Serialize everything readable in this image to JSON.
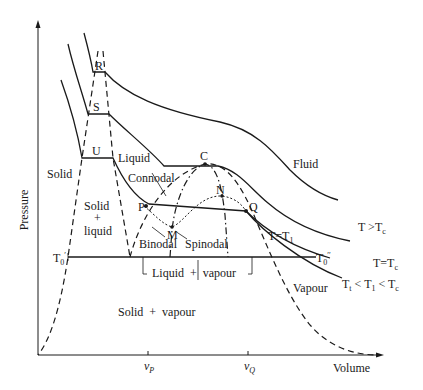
{
  "diagram": {
    "type": "pressure-volume phase diagram",
    "axes": {
      "y_label": "Pressure",
      "x_label": "Volume",
      "x_ticks": [
        {
          "symbol": "v",
          "subscript": "P"
        },
        {
          "symbol": "v",
          "subscript": "Q"
        }
      ]
    },
    "points": {
      "R": "R",
      "S": "S",
      "U": "U",
      "C": "C",
      "P": "P",
      "Q": "Q",
      "M": "M",
      "N": "N",
      "T0_prime": {
        "base": "T",
        "sub": "0",
        "mark": "′"
      },
      "T0_double_prime": {
        "base": "T",
        "sub": "0",
        "mark": "′′"
      }
    },
    "regions": {
      "solid": "Solid",
      "liquid": "Liquid",
      "fluid": "Fluid",
      "vapour": "Vapour",
      "solid_liquid_1": "Solid",
      "solid_liquid_2": "+",
      "solid_liquid_3": "liquid",
      "solid_vapour": "Solid  +  vapour",
      "liquid_vapour": "Liquid  +  vapour"
    },
    "curve_labels": {
      "connodal": "Connodal",
      "binodal": "Binodal",
      "spinodal": "Spinodal"
    },
    "isotherms": [
      {
        "label_base": "T >T",
        "label_sub": "c"
      },
      {
        "label_base": "T=T",
        "label_sub": "c"
      },
      {
        "label_base": "T=T",
        "label_sub": "1"
      },
      {
        "label_parts": [
          "T",
          "t",
          " < T",
          "1",
          " < T",
          "c"
        ]
      }
    ]
  }
}
